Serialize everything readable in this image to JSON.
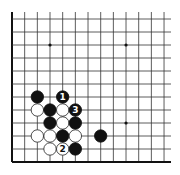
{
  "diagram": {
    "type": "go-board-corner",
    "corner": "lower-left",
    "grid": {
      "columns": 13,
      "rows": 12,
      "origin_x": 12,
      "origin_y": 19,
      "col_spacing": 12.67,
      "row_spacing": 13,
      "right_extent": 171,
      "top_extent": 12,
      "left_edge": true,
      "bottom_edge": true
    },
    "star_points": [
      {
        "col": 3,
        "row": 2
      },
      {
        "col": 9,
        "row": 2
      },
      {
        "col": 9,
        "row": 8
      }
    ],
    "stones": [
      {
        "color": "black",
        "col": 2,
        "row": 6,
        "label": ""
      },
      {
        "color": "black",
        "col": 4,
        "row": 6,
        "label": "1"
      },
      {
        "color": "white",
        "col": 2,
        "row": 7,
        "label": ""
      },
      {
        "color": "black",
        "col": 3,
        "row": 7,
        "label": ""
      },
      {
        "color": "white",
        "col": 4,
        "row": 7,
        "label": ""
      },
      {
        "color": "black",
        "col": 5,
        "row": 7,
        "label": "3"
      },
      {
        "color": "black",
        "col": 3,
        "row": 8,
        "label": ""
      },
      {
        "color": "white",
        "col": 4,
        "row": 8,
        "label": ""
      },
      {
        "color": "black",
        "col": 5,
        "row": 8,
        "label": ""
      },
      {
        "color": "white",
        "col": 2,
        "row": 9,
        "label": ""
      },
      {
        "color": "white",
        "col": 3,
        "row": 9,
        "label": ""
      },
      {
        "color": "black",
        "col": 4,
        "row": 9,
        "label": ""
      },
      {
        "color": "white",
        "col": 5,
        "row": 9,
        "label": ""
      },
      {
        "color": "black",
        "col": 7,
        "row": 9,
        "label": ""
      },
      {
        "color": "white",
        "col": 3,
        "row": 10,
        "label": ""
      },
      {
        "color": "white",
        "col": 4,
        "row": 10,
        "label": "2"
      },
      {
        "color": "black",
        "col": 5,
        "row": 10,
        "label": ""
      }
    ],
    "colors": {
      "line": "#333333",
      "edge": "#111111",
      "black_stone": "#111111",
      "white_stone": "#ffffff",
      "white_stone_stroke": "#222222"
    }
  }
}
